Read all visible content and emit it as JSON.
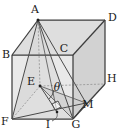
{
  "figure": {
    "background_color": "#ffffff",
    "edge_color": "#3a3a3a",
    "hidden_edge_color": "#8d8d8d",
    "face_fill_light": "#e6e6e6",
    "face_fill_mid": "#dcdcdc",
    "face_fill_dark": "#cfcfcf",
    "pyramid_fill": "#d8d8d8"
  },
  "labels": {
    "A": "A",
    "B": "B",
    "C": "C",
    "D": "D",
    "E": "E",
    "F": "F",
    "G": "G",
    "H": "H",
    "I": "I",
    "M": "M",
    "theta": "θ"
  },
  "vertices": {
    "A": {
      "x": 38,
      "y": 20
    },
    "B": {
      "x": 12,
      "y": 55
    },
    "C": {
      "x": 73,
      "y": 55
    },
    "D": {
      "x": 105,
      "y": 20
    },
    "E": {
      "x": 40,
      "y": 86
    },
    "F": {
      "x": 12,
      "y": 119
    },
    "G": {
      "x": 73,
      "y": 119
    },
    "H": {
      "x": 105,
      "y": 84
    },
    "I": {
      "x": 57,
      "y": 112
    },
    "M": {
      "x": 86,
      "y": 103
    }
  },
  "label_positions": {
    "A": {
      "x": 35,
      "y": 13
    },
    "B": {
      "x": 2,
      "y": 56
    },
    "C": {
      "x": 63,
      "y": 51
    },
    "D": {
      "x": 108,
      "y": 20
    },
    "E": {
      "x": 31,
      "y": 84
    },
    "F": {
      "x": 1,
      "y": 124
    },
    "G": {
      "x": 75,
      "y": 128
    },
    "H": {
      "x": 107,
      "y": 82
    },
    "I": {
      "x": 46,
      "y": 128
    },
    "M": {
      "x": 88,
      "y": 108
    },
    "theta": {
      "x": 56,
      "y": 91
    }
  },
  "annotations": {
    "right_angle_marker": "right-angle-square-at-I",
    "angle_marked": "θ",
    "angle_vertex": "E",
    "leader_from_label_I_to_point_I": true
  }
}
